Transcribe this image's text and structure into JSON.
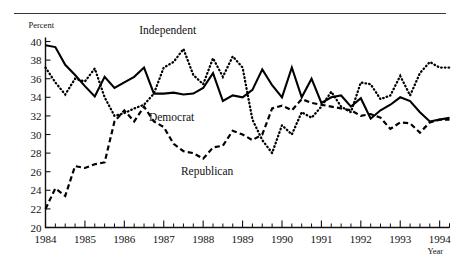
{
  "chart_data": {
    "type": "line",
    "title": "",
    "xlabel": "Year",
    "ylabel": "Percent",
    "ylim": [
      20,
      40
    ],
    "xlim": [
      1984.0,
      1994.25
    ],
    "ytick_step": 2,
    "yticks": [
      20,
      22,
      24,
      26,
      28,
      30,
      32,
      34,
      36,
      38,
      40
    ],
    "xticks": [
      1984,
      1985,
      1986,
      1987,
      1988,
      1989,
      1990,
      1991,
      1992,
      1993,
      1994
    ],
    "x_minor_per_year": 4,
    "grid": false,
    "legend": "inline-annotations",
    "annotations": [
      {
        "text": "Independent",
        "x": 1987.1,
        "y": 41.2
      },
      {
        "text": "Democrat",
        "x": 1987.2,
        "y": 31.9
      },
      {
        "text": "Republican",
        "x": 1988.1,
        "y": 26.1
      }
    ],
    "x": [
      1984.0,
      1984.25,
      1984.5,
      1984.75,
      1985.0,
      1985.25,
      1985.5,
      1985.75,
      1986.0,
      1986.25,
      1986.5,
      1986.75,
      1987.0,
      1987.25,
      1987.5,
      1987.75,
      1988.0,
      1988.25,
      1988.5,
      1988.75,
      1989.0,
      1989.25,
      1989.5,
      1989.75,
      1990.0,
      1990.25,
      1990.5,
      1990.75,
      1991.0,
      1991.25,
      1991.5,
      1991.75,
      1992.0,
      1992.25,
      1992.5,
      1992.75,
      1993.0,
      1993.25,
      1993.5,
      1993.75,
      1994.0,
      1994.25
    ],
    "series": [
      {
        "name": "Democrat",
        "style": "solid",
        "values": [
          39.6,
          39.4,
          37.5,
          36.4,
          35.2,
          34.1,
          36.2,
          35.0,
          35.6,
          36.2,
          37.2,
          34.4,
          34.4,
          34.5,
          34.3,
          34.4,
          35.0,
          36.6,
          33.6,
          34.2,
          34.0,
          34.8,
          37.0,
          35.3,
          34.0,
          37.2,
          34.0,
          36.0,
          33.4,
          34.0,
          34.2,
          33.0,
          33.9,
          31.7,
          32.6,
          33.2,
          34.0,
          33.6,
          32.4,
          31.4,
          31.6,
          31.8
        ]
      },
      {
        "name": "Independent",
        "style": "dotted",
        "values": [
          37.2,
          35.6,
          34.3,
          36.0,
          35.7,
          37.1,
          34.0,
          32.0,
          32.3,
          32.8,
          33.2,
          34.4,
          37.2,
          37.8,
          39.2,
          36.4,
          35.4,
          38.2,
          36.2,
          38.4,
          37.2,
          31.6,
          29.4,
          28.0,
          31.0,
          30.0,
          32.4,
          31.8,
          33.0,
          34.6,
          33.0,
          32.4,
          35.6,
          35.4,
          33.8,
          34.2,
          36.3,
          34.2,
          36.6,
          37.8,
          37.2,
          37.2
        ]
      },
      {
        "name": "Republican",
        "style": "dashed",
        "values": [
          22.0,
          24.2,
          23.4,
          26.6,
          26.4,
          26.8,
          27.0,
          31.4,
          32.6,
          31.4,
          33.0,
          31.4,
          30.8,
          29.0,
          28.2,
          28.0,
          27.4,
          28.6,
          28.8,
          30.4,
          30.0,
          29.4,
          30.0,
          32.8,
          33.1,
          32.6,
          33.8,
          33.4,
          33.2,
          33.0,
          32.8,
          32.6,
          32.0,
          32.2,
          31.8,
          30.6,
          31.3,
          31.2,
          30.2,
          31.3,
          31.6,
          31.6
        ]
      }
    ]
  },
  "axis": {
    "y_title": "Percent",
    "x_title": "Year"
  }
}
